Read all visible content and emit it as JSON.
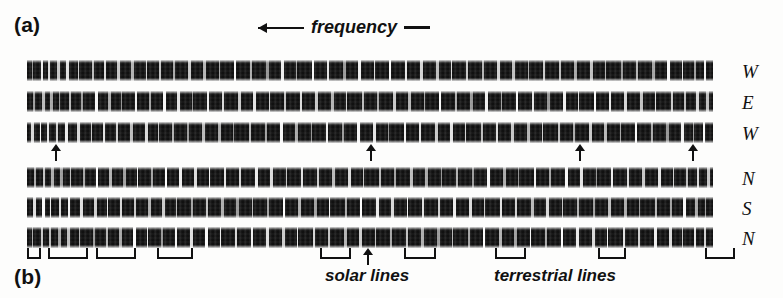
{
  "figure": {
    "panel_a_label": "(a)",
    "panel_b_label": "(b)",
    "frequency_axis_label": "frequency",
    "frequency_axis_direction": "left",
    "caption_solar": "solar lines",
    "caption_terrestrial": "terrestrial lines",
    "ink_color": "#111111",
    "band_color": "#0d0d0d",
    "background_color": "#fdfdfc"
  },
  "chart_data": {
    "type": "heatmap",
    "title": "",
    "subtitle": "",
    "xlabel": "frequency",
    "ylabel": "",
    "grid": false,
    "legend_position": "right",
    "notes": [
      "Photographic spectrogram plate: six horizontal spectral strips",
      "Dark bands crossed by bright vertical absorption/emission lines",
      "Frequency increases toward the left (arrow points left)",
      "Arrows under strip 3 mark reference lines",
      "Brackets under strip 6 mark line groups; solar and terrestrial lines called out"
    ],
    "panels": [
      {
        "panel": "(a)",
        "row_labels": [
          "W",
          "E",
          "W"
        ]
      },
      {
        "panel": "(b)",
        "row_labels": [
          "N",
          "S",
          "N"
        ]
      }
    ],
    "row_labels_all": [
      "W",
      "E",
      "W",
      "N",
      "S",
      "N"
    ],
    "strip_extent_px": {
      "left": 27,
      "right": 713
    },
    "rows": [
      {
        "id": "row-1",
        "label": "W",
        "group": "a",
        "top": 60,
        "line_positions": [
          32,
          41,
          48,
          57,
          66,
          78,
          92,
          104,
          117,
          131,
          146,
          159,
          173,
          188,
          203,
          219,
          234,
          250,
          266,
          281,
          296,
          312,
          327,
          343,
          358,
          374,
          389,
          405,
          420,
          436,
          451,
          466,
          482,
          497,
          512,
          528,
          543,
          559,
          574,
          590,
          605,
          621,
          636,
          652,
          667,
          682,
          694,
          704
        ]
      },
      {
        "id": "row-2",
        "label": "E",
        "group": "a",
        "top": 91,
        "line_positions": [
          33,
          42,
          50,
          59,
          69,
          81,
          95,
          108,
          121,
          135,
          149,
          163,
          177,
          192,
          207,
          222,
          238,
          253,
          269,
          284,
          300,
          315,
          331,
          346,
          362,
          377,
          393,
          408,
          424,
          439,
          455,
          470,
          485,
          501,
          516,
          532,
          547,
          563,
          578,
          594,
          609,
          624,
          640,
          655,
          671,
          684,
          696,
          706
        ]
      },
      {
        "id": "row-3",
        "label": "W",
        "group": "a",
        "top": 122,
        "line_positions": [
          31,
          40,
          47,
          56,
          65,
          77,
          91,
          103,
          116,
          130,
          145,
          158,
          172,
          187,
          202,
          218,
          233,
          249,
          265,
          280,
          295,
          311,
          326,
          342,
          357,
          373,
          388,
          404,
          419,
          435,
          450,
          465,
          481,
          496,
          511,
          527,
          542,
          558,
          573,
          589,
          604,
          620,
          635,
          651,
          666,
          681,
          693,
          703
        ]
      },
      {
        "id": "row-4",
        "label": "N",
        "group": "b",
        "top": 167,
        "line_positions": [
          34,
          43,
          51,
          60,
          70,
          83,
          96,
          109,
          123,
          137,
          151,
          165,
          179,
          194,
          209,
          224,
          239,
          255,
          270,
          286,
          301,
          317,
          332,
          348,
          363,
          379,
          394,
          410,
          425,
          441,
          456,
          472,
          487,
          503,
          518,
          534,
          549,
          565,
          580,
          596,
          611,
          627,
          642,
          658,
          673,
          686,
          697,
          707
        ]
      },
      {
        "id": "row-5",
        "label": "S",
        "group": "b",
        "top": 197,
        "line_positions": [
          33,
          42,
          50,
          59,
          68,
          80,
          94,
          107,
          120,
          134,
          148,
          162,
          176,
          191,
          206,
          221,
          236,
          252,
          267,
          283,
          298,
          314,
          329,
          345,
          360,
          376,
          391,
          407,
          422,
          438,
          453,
          469,
          484,
          500,
          515,
          531,
          546,
          562,
          577,
          593,
          608,
          624,
          639,
          655,
          670,
          683,
          695,
          705
        ]
      },
      {
        "id": "row-6",
        "label": "N",
        "group": "b",
        "top": 227,
        "line_positions": [
          32,
          41,
          49,
          58,
          67,
          79,
          93,
          106,
          119,
          133,
          147,
          161,
          175,
          190,
          205,
          220,
          235,
          251,
          266,
          282,
          297,
          313,
          328,
          344,
          359,
          375,
          390,
          406,
          421,
          437,
          452,
          468,
          483,
          499,
          514,
          530,
          545,
          561,
          576,
          592,
          607,
          623,
          638,
          654,
          669,
          682,
          694,
          704
        ]
      }
    ],
    "reference_arrows": {
      "attached_to_row": "row-3",
      "count": 4,
      "x_positions": [
        56,
        371,
        580,
        693
      ]
    },
    "line_group_brackets": {
      "attached_to_row": "row-6",
      "count": 9,
      "items": [
        {
          "left": 27,
          "width": 10
        },
        {
          "left": 48,
          "width": 36
        },
        {
          "left": 96,
          "width": 36
        },
        {
          "left": 157,
          "width": 32
        },
        {
          "left": 320,
          "width": 27
        },
        {
          "left": 404,
          "width": 28
        },
        {
          "left": 495,
          "width": 27
        },
        {
          "left": 598,
          "width": 24
        },
        {
          "left": 705,
          "width": 26
        }
      ]
    },
    "solar_line_marker": {
      "attached_to_row": "row-6",
      "x_position": 368
    }
  }
}
